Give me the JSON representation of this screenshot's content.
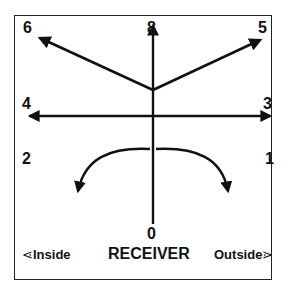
{
  "diagram": {
    "directions": {
      "d0": "0",
      "d1": "1",
      "d2": "2",
      "d3": "3",
      "d4": "4",
      "d5": "5",
      "d6": "6",
      "d8": "8"
    },
    "bottom": {
      "inside_label": "Inside",
      "inside_arrow": "⋖",
      "receiver_label": "RECEIVER",
      "outside_label": "Outside",
      "outside_arrow": "⋗"
    },
    "colors": {
      "line": "#111111",
      "background": "#ffffff"
    }
  }
}
